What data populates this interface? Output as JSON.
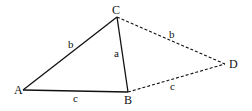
{
  "diagram": {
    "type": "geometric-figure",
    "points": {
      "A": {
        "label": "A",
        "x": 23,
        "y": 90
      },
      "B": {
        "label": "B",
        "x": 128,
        "y": 92
      },
      "C": {
        "label": "C",
        "x": 117,
        "y": 17
      },
      "D": {
        "label": "D",
        "x": 225,
        "y": 64
      }
    },
    "segments": [
      {
        "from": "A",
        "to": "C",
        "label": "b",
        "style": "solid"
      },
      {
        "from": "C",
        "to": "B",
        "label": "a",
        "style": "solid"
      },
      {
        "from": "A",
        "to": "B",
        "label": "c",
        "style": "solid"
      },
      {
        "from": "C",
        "to": "D",
        "label": "b",
        "style": "dashed"
      },
      {
        "from": "B",
        "to": "D",
        "label": "c",
        "style": "dashed"
      }
    ],
    "labels": {
      "A": "A",
      "B": "B",
      "C": "C",
      "D": "D",
      "side_AC": "b",
      "side_CB": "a",
      "side_AB": "c",
      "side_CD": "b",
      "side_BD": "c"
    },
    "colors": {
      "line": "#111111",
      "background": "#ffffff"
    }
  }
}
